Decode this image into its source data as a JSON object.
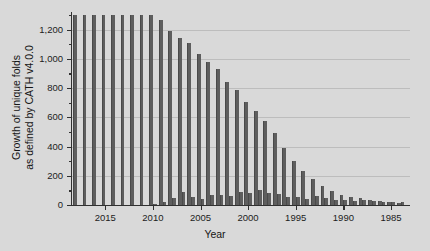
{
  "chart_data": {
    "type": "bar",
    "title": "",
    "subtitle": "",
    "xlabel": "Year",
    "ylabel": "Growth of unique folds as defined by CATH v4.0.0",
    "ylabel_line1": "Growth of unique folds",
    "ylabel_line2": "as defined by CATH v4.0.0",
    "grid": true,
    "legend": false,
    "legend_position": "none",
    "xlim": [
      2018.5,
      1983.0
    ],
    "ylim": [
      0,
      1320
    ],
    "x_direction": "descending",
    "ytick_labels": [
      "0",
      "200",
      "400",
      "600",
      "800",
      "1,000",
      "1,200"
    ],
    "ytick_values": [
      0,
      200,
      400,
      600,
      800,
      1000,
      1200
    ],
    "ytick_minor_values": [
      100,
      300,
      500,
      700,
      900,
      1100,
      1300
    ],
    "xtick_labels": [
      "2015",
      "2010",
      "2005",
      "2000",
      "1995",
      "1990",
      "1985"
    ],
    "xtick_values": [
      2015,
      2010,
      2005,
      2000,
      1995,
      1990,
      1985
    ],
    "bar_color": "#5e5e5e",
    "grid_color": "#bdbdbd",
    "background_color": "#d9d9d9",
    "axis_color": "#303030",
    "categories": [
      2018,
      2017,
      2016,
      2015,
      2014,
      2013,
      2012,
      2011,
      2010,
      2009,
      2008,
      2007,
      2006,
      2005,
      2004,
      2003,
      2002,
      2001,
      2000,
      1999,
      1998,
      1997,
      1996,
      1995,
      1994,
      1993,
      1992,
      1991,
      1990,
      1989,
      1988,
      1987,
      1986,
      1985,
      1984
    ],
    "series": [
      {
        "name": "Cumulative unique folds",
        "values": [
          1300,
          1300,
          1300,
          1300,
          1300,
          1300,
          1300,
          1300,
          1300,
          1265,
          1190,
          1145,
          1110,
          1030,
          975,
          930,
          845,
          790,
          705,
          640,
          575,
          490,
          390,
          300,
          235,
          180,
          130,
          95,
          70,
          55,
          45,
          36,
          28,
          22,
          16
        ]
      },
      {
        "name": "New folds per year",
        "values": [
          0,
          0,
          0,
          0,
          0,
          0,
          0,
          0,
          8,
          18,
          45,
          88,
          55,
          38,
          70,
          66,
          60,
          88,
          84,
          102,
          83,
          75,
          54,
          55,
          42,
          62,
          47,
          34,
          36,
          30,
          32,
          25,
          23,
          24,
          24
        ]
      }
    ]
  }
}
